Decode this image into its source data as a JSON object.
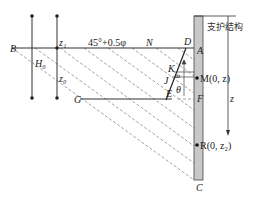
{
  "diagram": {
    "title_label": "支护结构",
    "angle_label": "45°+0.5φ",
    "points": {
      "B": "B",
      "N": "N",
      "D": "D",
      "A": "A",
      "K": "K",
      "J": "J",
      "E": "E",
      "F": "F",
      "G": "G",
      "C": "C"
    },
    "point_M": "M(0, z)",
    "point_R": "R(0, z₂)",
    "theta": "θ",
    "dims": {
      "H0": "H₀",
      "z1": "z₁",
      "z0": "z₀",
      "z_axis": "z",
      "dz": "dz"
    },
    "colors": {
      "wall_fill": "#c8c8c8",
      "line": "#333333",
      "dashed": "#888888"
    }
  }
}
